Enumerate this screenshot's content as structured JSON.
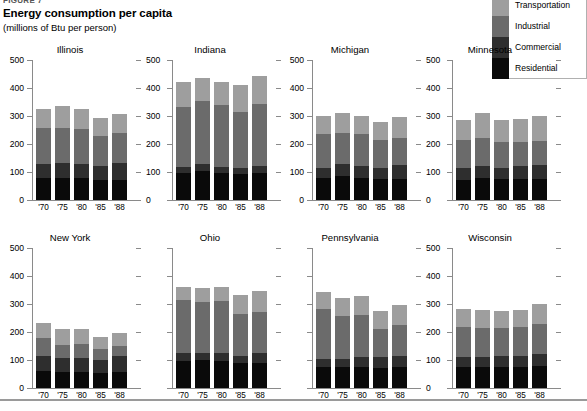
{
  "header": {
    "figure_number": "FIGURE 7",
    "title": "Energy consumption per capita",
    "subtitle": "(millions of Btu per person)"
  },
  "legend": {
    "items": [
      {
        "label": "Transportation",
        "color": "#9e9e9e"
      },
      {
        "label": "Industrial",
        "color": "#6b6b6b"
      },
      {
        "label": "Commercial",
        "color": "#2e2e2e"
      },
      {
        "label": "Residential",
        "color": "#0a0a0a"
      }
    ]
  },
  "axis": {
    "y_ticks": [
      0,
      100,
      200,
      300,
      400,
      500
    ],
    "y_min": 0,
    "y_max": 500,
    "x_categories": [
      "'70",
      "'75",
      "'80",
      "'85",
      "'88"
    ]
  },
  "chart_data": {
    "type": "bar",
    "stacked": true,
    "small_multiples": true,
    "title": "Energy consumption per capita",
    "subtitle": "(millions of Btu per person)",
    "xlabel": "",
    "ylabel": "millions of Btu per person",
    "ylim": [
      0,
      500
    ],
    "y_ticks": [
      0,
      100,
      200,
      300,
      400,
      500
    ],
    "grid": false,
    "legend_position": "top-right",
    "categories": [
      "'70",
      "'75",
      "'80",
      "'85",
      "'88"
    ],
    "series_order": [
      "Residential",
      "Commercial",
      "Industrial",
      "Transportation"
    ],
    "series_colors": {
      "Residential": "#0a0a0a",
      "Commercial": "#2e2e2e",
      "Industrial": "#6b6b6b",
      "Transportation": "#9e9e9e"
    },
    "panels": [
      {
        "name": "Illinois",
        "series": [
          {
            "name": "Residential",
            "values": [
              80,
              80,
              78,
              72,
              72
            ]
          },
          {
            "name": "Commercial",
            "values": [
              48,
              53,
              52,
              50,
              60
            ]
          },
          {
            "name": "Industrial",
            "values": [
              128,
              125,
              124,
              108,
              108
            ]
          },
          {
            "name": "Transportation",
            "values": [
              70,
              78,
              70,
              62,
              67
            ]
          }
        ],
        "totals": [
          326,
          336,
          324,
          292,
          307
        ]
      },
      {
        "name": "Indiana",
        "series": [
          {
            "name": "Residential",
            "values": [
              95,
              105,
              96,
              94,
              98
            ]
          },
          {
            "name": "Commercial",
            "values": [
              22,
              22,
              23,
              20,
              23
            ]
          },
          {
            "name": "Industrial",
            "values": [
              216,
              225,
              220,
              200,
              223
            ]
          },
          {
            "name": "Transportation",
            "values": [
              88,
              85,
              84,
              98,
              99
            ]
          }
        ],
        "totals": [
          421,
          437,
          423,
          412,
          443
        ]
      },
      {
        "name": "Michigan",
        "series": [
          {
            "name": "Residential",
            "values": [
              78,
              84,
              80,
              74,
              76
            ]
          },
          {
            "name": "Commercial",
            "values": [
              38,
              44,
              42,
              42,
              50
            ]
          },
          {
            "name": "Industrial",
            "values": [
              119,
              113,
              115,
              98,
              96
            ]
          },
          {
            "name": "Transportation",
            "values": [
              64,
              70,
              63,
              65,
              74
            ]
          }
        ],
        "totals": [
          299,
          311,
          300,
          279,
          296
        ]
      },
      {
        "name": "Minnesota",
        "series": [
          {
            "name": "Residential",
            "values": [
              72,
              78,
              74,
              75,
              76
            ]
          },
          {
            "name": "Commercial",
            "values": [
              43,
              45,
              42,
              45,
              48
            ]
          },
          {
            "name": "Industrial",
            "values": [
              98,
              100,
              92,
              88,
              87
            ]
          },
          {
            "name": "Transportation",
            "values": [
              74,
              87,
              78,
              80,
              90
            ]
          }
        ],
        "totals": [
          287,
          310,
          286,
          288,
          301
        ]
      },
      {
        "name": "New York",
        "series": [
          {
            "name": "Residential",
            "values": [
              62,
              58,
              58,
              55,
              57
            ]
          },
          {
            "name": "Commercial",
            "values": [
              52,
              48,
              49,
              44,
              58
            ]
          },
          {
            "name": "Industrial",
            "values": [
              63,
              48,
              49,
              41,
              35
            ]
          },
          {
            "name": "Transportation",
            "values": [
              55,
              57,
              56,
              44,
              47
            ]
          }
        ],
        "totals": [
          232,
          211,
          212,
          184,
          197
        ]
      },
      {
        "name": "Ohio",
        "series": [
          {
            "name": "Residential",
            "values": [
              98,
              100,
              98,
              88,
              90
            ]
          },
          {
            "name": "Commercial",
            "values": [
              26,
              26,
              28,
              28,
              35
            ]
          },
          {
            "name": "Industrial",
            "values": [
              190,
              183,
              184,
              148,
              148
            ]
          },
          {
            "name": "Transportation",
            "values": [
              46,
              50,
              50,
              70,
              73
            ]
          }
        ],
        "totals": [
          360,
          359,
          360,
          334,
          346
        ]
      },
      {
        "name": "Pennsylvania",
        "series": [
          {
            "name": "Residential",
            "values": [
              76,
              76,
              76,
              70,
              74
            ]
          },
          {
            "name": "Commercial",
            "values": [
              28,
              28,
              35,
              40,
              40
            ]
          },
          {
            "name": "Industrial",
            "values": [
              178,
              155,
              150,
              100,
              110
            ]
          },
          {
            "name": "Transportation",
            "values": [
              60,
              62,
              68,
              65,
              73
            ]
          }
        ],
        "totals": [
          342,
          321,
          329,
          275,
          297
        ]
      },
      {
        "name": "Wisconsin",
        "series": [
          {
            "name": "Residential",
            "values": [
              76,
              76,
              75,
              76,
              78
            ]
          },
          {
            "name": "Commercial",
            "values": [
              34,
              34,
              38,
              40,
              42
            ]
          },
          {
            "name": "Industrial",
            "values": [
              108,
              103,
              101,
              102,
              108
            ]
          },
          {
            "name": "Transportation",
            "values": [
              64,
              67,
              62,
              61,
              72
            ]
          }
        ],
        "totals": [
          282,
          280,
          276,
          279,
          300
        ]
      }
    ]
  }
}
